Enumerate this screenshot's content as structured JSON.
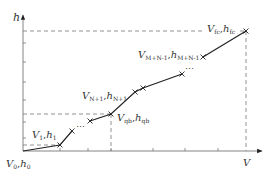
{
  "diagram": {
    "type": "piecewise-linear curve (h vs V)",
    "axes": {
      "x_label": "V",
      "y_label": "h"
    },
    "points": [
      {
        "id": "p0",
        "name": "V0,h0",
        "label_main_v": "V",
        "label_sub_v": "0",
        "label_main_h": "h",
        "label_sub_h": "0"
      },
      {
        "id": "p1",
        "name": "V1,h1",
        "label_main_v": "V",
        "label_sub_v": "1",
        "label_main_h": "h",
        "label_sub_h": "1"
      },
      {
        "id": "pqb",
        "name": "Vqb,hqb",
        "label_main_v": "V",
        "label_sub_v": "qb",
        "label_main_h": "h",
        "label_sub_h": "qb"
      },
      {
        "id": "pN1",
        "name": "VN+1,hN+1",
        "label_main_v": "V",
        "label_sub_v": "N+1",
        "label_main_h": "h",
        "label_sub_h": "N+1"
      },
      {
        "id": "pMN1",
        "name": "VM+N-1,hM+N-1",
        "label_main_v": "V",
        "label_sub_v": "M+N-1",
        "label_main_h": "h",
        "label_sub_h": "M+N-1"
      },
      {
        "id": "pfc",
        "name": "Vfc,hfc",
        "label_main_v": "V",
        "label_sub_v": "fc",
        "label_main_h": "h",
        "label_sub_h": "fc"
      }
    ],
    "ellipsis": "…",
    "separator": ","
  }
}
